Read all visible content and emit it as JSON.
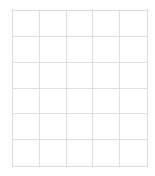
{
  "grid": {
    "columns": 5,
    "rows": 6,
    "line_color": "#dedede",
    "background": "#ffffff",
    "cells": [
      [
        "",
        "",
        "",
        "",
        ""
      ],
      [
        "",
        "",
        "",
        "",
        ""
      ],
      [
        "",
        "",
        "",
        "",
        ""
      ],
      [
        "",
        "",
        "",
        "",
        ""
      ],
      [
        "",
        "",
        "",
        "",
        ""
      ],
      [
        "",
        "",
        "",
        "",
        ""
      ]
    ]
  }
}
